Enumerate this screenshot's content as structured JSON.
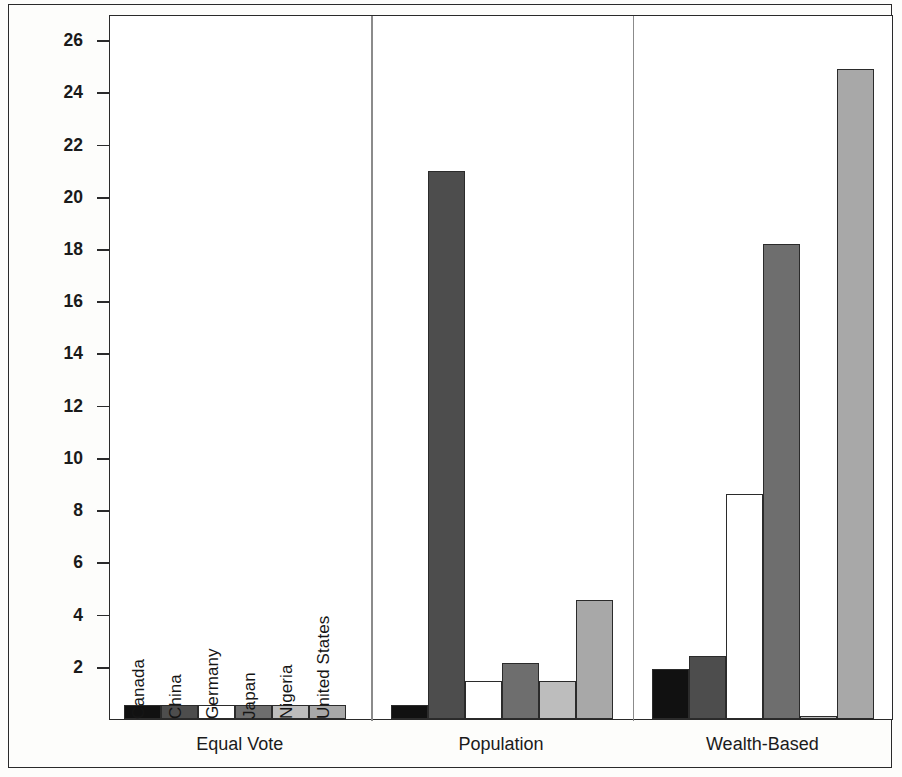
{
  "chart_data": {
    "type": "bar",
    "title": "",
    "xlabel": "",
    "ylabel": "Percentage of UNGA Vote",
    "ylim": [
      0,
      27
    ],
    "yticks": [
      2,
      4,
      6,
      8,
      10,
      12,
      14,
      16,
      18,
      20,
      22,
      24,
      26
    ],
    "ytick_labels": [
      "2",
      "4",
      "6",
      "8",
      "10",
      "12",
      "14",
      "16",
      "18",
      "20",
      "22",
      "24",
      "26"
    ],
    "grid": false,
    "legend_position": "none",
    "categories": [
      "Equal Vote",
      "Population",
      "Wealth-Based"
    ],
    "series": [
      {
        "name": "Canada",
        "values": [
          0.52,
          0.52,
          1.9
        ],
        "color": "#111111"
      },
      {
        "name": "China",
        "values": [
          0.52,
          21.0,
          2.4
        ],
        "color": "#4d4d4d"
      },
      {
        "name": "Germany",
        "values": [
          0.52,
          1.45,
          8.6
        ],
        "color": "#ffffff"
      },
      {
        "name": "Japan",
        "values": [
          0.52,
          2.15,
          18.2
        ],
        "color": "#6e6e6e"
      },
      {
        "name": "Nigeria",
        "values": [
          0.52,
          1.45,
          0.12
        ],
        "color": "#bdbdbd"
      },
      {
        "name": "United States",
        "values": [
          0.52,
          4.55,
          24.9
        ],
        "color": "#a8a8a8"
      }
    ],
    "in_plot_series_labels": [
      "Canada",
      "China",
      "Germany",
      "Japan",
      "Nigeria",
      "United States"
    ],
    "axis_color": "#2a2a2a",
    "bar_edge_color": "#2b2b2b",
    "background_color": "#ffffff"
  }
}
